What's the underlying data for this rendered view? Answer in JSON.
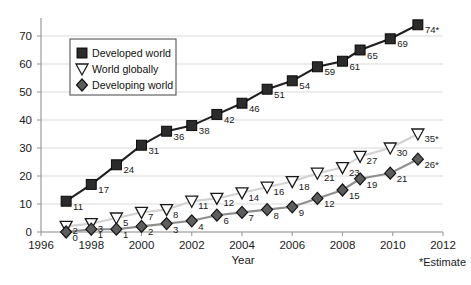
{
  "chart_data": {
    "type": "line",
    "title": "",
    "xlabel": "Year",
    "ylabel": "",
    "xlim": [
      1996,
      2012
    ],
    "ylim": [
      0,
      75
    ],
    "xticks": [
      "1996",
      "1998",
      "2000",
      "2002",
      "2004",
      "2006",
      "2008",
      "2010",
      "2012"
    ],
    "yticks": [
      "0",
      "10",
      "20",
      "30",
      "40",
      "50",
      "60",
      "70"
    ],
    "grid": true,
    "legend_position": "upper-left-inside",
    "annotations": [
      "*Estimate"
    ],
    "x": [
      1997,
      1998,
      1999,
      2000,
      2001,
      2002,
      2003,
      2004,
      2005,
      2006,
      2007,
      2008,
      2008.7,
      2009.9,
      2011
    ],
    "series": [
      {
        "name": "Developed world",
        "marker": "square",
        "color": "#231f20",
        "values": [
          11,
          17,
          24,
          31,
          36,
          38,
          42,
          46,
          51,
          54,
          59,
          61,
          65,
          69,
          74
        ],
        "labels": [
          "11",
          "17",
          "24",
          "31",
          "36",
          "38",
          "42",
          "46",
          "51",
          "54",
          "59",
          "61",
          "65",
          "69",
          "74*"
        ]
      },
      {
        "name": "World globally",
        "marker": "triangle-down",
        "color": "#d2d2d2",
        "values": [
          2,
          3,
          5,
          7,
          8,
          11,
          12,
          14,
          16,
          18,
          21,
          23,
          27,
          30,
          35
        ],
        "labels": [
          "2",
          "3",
          "5",
          "7",
          "8",
          "11",
          "12",
          "14",
          "16",
          "18",
          "21",
          "23",
          "27",
          "30",
          "35*"
        ]
      },
      {
        "name": "Developing world",
        "marker": "diamond",
        "color": "#8e8e8e",
        "values": [
          0,
          1,
          1,
          2,
          3,
          4,
          6,
          7,
          8,
          9,
          12,
          15,
          19,
          21,
          26
        ],
        "labels": [
          "0",
          "1",
          "1",
          "2",
          "3",
          "4",
          "6",
          "7",
          "8",
          "9",
          "12",
          "15",
          "19",
          "21",
          "26*"
        ]
      }
    ]
  },
  "legend": {
    "items": [
      {
        "label": "Developed world"
      },
      {
        "label": "World globally"
      },
      {
        "label": "Developing world"
      }
    ]
  },
  "axis": {
    "x_title": "Year",
    "footnote": "*Estimate"
  }
}
